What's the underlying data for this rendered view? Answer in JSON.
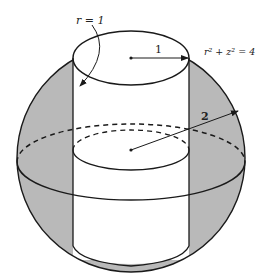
{
  "figure": {
    "labels": {
      "cylinder_radius_eq": "r = 1",
      "cylinder_radius_value": "1",
      "sphere_equation": "r² + z² = 4",
      "sphere_radius_value": "2"
    },
    "colors": {
      "shading": "#b8b8b8",
      "stroke": "#1a1a1a",
      "background": "#ffffff"
    }
  }
}
